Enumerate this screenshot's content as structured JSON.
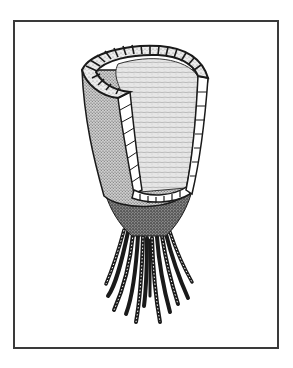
{
  "figure": {
    "frame_color": "#3a3a3a",
    "ink_color": "#1a1a1a",
    "background": "#ffffff",
    "stipple_light": "#d9d9d9",
    "stipple_mid": "#9a9a9a",
    "stipple_dark": "#4a4a4a",
    "holdfast_count": 12
  }
}
